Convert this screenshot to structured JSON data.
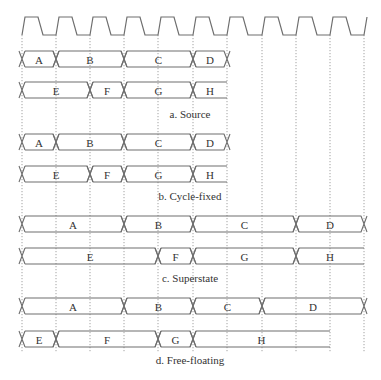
{
  "figure": {
    "width": 381,
    "height": 380,
    "colors": {
      "line": "#6e6e6e",
      "grid": "#8a8a8a",
      "text": "#333333",
      "background": "#ffffff"
    }
  },
  "clock": {
    "edges_x": [
      22,
      56,
      90,
      124,
      158,
      193,
      227,
      262,
      296,
      330,
      364
    ],
    "high_y": 17,
    "low_y": 35,
    "rise_width": 3,
    "fall_start_offset": 16,
    "fall_width": 5
  },
  "grid": {
    "top_y": 35,
    "bottom_y": 352
  },
  "panels": [
    {
      "id": "source",
      "caption": "a. Source",
      "caption_y": 118,
      "rows": [
        {
          "y_top": 51,
          "y_bot": 67,
          "segments": [
            {
              "label": "A",
              "x0": 22,
              "x1": 56,
              "open_end": false
            },
            {
              "label": "B",
              "x0": 56,
              "x1": 124,
              "open_end": false
            },
            {
              "label": "C",
              "x0": 124,
              "x1": 193,
              "open_end": false
            },
            {
              "label": "D",
              "x0": 193,
              "x1": 227,
              "open_end": false
            }
          ]
        },
        {
          "y_top": 82,
          "y_bot": 98,
          "segments": [
            {
              "label": "E",
              "x0": 22,
              "x1": 90,
              "open_end": false
            },
            {
              "label": "F",
              "x0": 90,
              "x1": 124,
              "open_end": false
            },
            {
              "label": "G",
              "x0": 124,
              "x1": 193,
              "open_end": false
            },
            {
              "label": "H",
              "x0": 193,
              "x1": 227,
              "open_end": true
            }
          ]
        }
      ]
    },
    {
      "id": "cycle-fixed",
      "caption": "b. Cycle-fixed",
      "caption_y": 200,
      "rows": [
        {
          "y_top": 134,
          "y_bot": 150,
          "segments": [
            {
              "label": "A",
              "x0": 22,
              "x1": 56,
              "open_end": false
            },
            {
              "label": "B",
              "x0": 56,
              "x1": 124,
              "open_end": false
            },
            {
              "label": "C",
              "x0": 124,
              "x1": 193,
              "open_end": false
            },
            {
              "label": "D",
              "x0": 193,
              "x1": 227,
              "open_end": false
            }
          ]
        },
        {
          "y_top": 166,
          "y_bot": 182,
          "segments": [
            {
              "label": "E",
              "x0": 22,
              "x1": 90,
              "open_end": false
            },
            {
              "label": "F",
              "x0": 90,
              "x1": 124,
              "open_end": false
            },
            {
              "label": "G",
              "x0": 124,
              "x1": 193,
              "open_end": false
            },
            {
              "label": "H",
              "x0": 193,
              "x1": 227,
              "open_end": true
            }
          ]
        }
      ]
    },
    {
      "id": "superstate",
      "caption": "c. Superstate",
      "caption_y": 282,
      "rows": [
        {
          "y_top": 216,
          "y_bot": 232,
          "segments": [
            {
              "label": "A",
              "x0": 22,
              "x1": 124,
              "open_end": false
            },
            {
              "label": "B",
              "x0": 124,
              "x1": 193,
              "open_end": false
            },
            {
              "label": "C",
              "x0": 193,
              "x1": 296,
              "open_end": false
            },
            {
              "label": "D",
              "x0": 296,
              "x1": 364,
              "open_end": false
            }
          ]
        },
        {
          "y_top": 248,
          "y_bot": 264,
          "segments": [
            {
              "label": "E",
              "x0": 22,
              "x1": 158,
              "open_end": false
            },
            {
              "label": "F",
              "x0": 158,
              "x1": 193,
              "open_end": false
            },
            {
              "label": "G",
              "x0": 193,
              "x1": 296,
              "open_end": false
            },
            {
              "label": "H",
              "x0": 296,
              "x1": 364,
              "open_end": true
            }
          ]
        }
      ]
    },
    {
      "id": "free-floating",
      "caption": "d. Free-floating",
      "caption_y": 364,
      "rows": [
        {
          "y_top": 298,
          "y_bot": 314,
          "segments": [
            {
              "label": "A",
              "x0": 22,
              "x1": 124,
              "open_end": false
            },
            {
              "label": "B",
              "x0": 124,
              "x1": 193,
              "open_end": false
            },
            {
              "label": "C",
              "x0": 193,
              "x1": 262,
              "open_end": false
            },
            {
              "label": "D",
              "x0": 262,
              "x1": 364,
              "open_end": false
            }
          ]
        },
        {
          "y_top": 331,
          "y_bot": 347,
          "segments": [
            {
              "label": "E",
              "x0": 22,
              "x1": 56,
              "open_end": false
            },
            {
              "label": "F",
              "x0": 56,
              "x1": 158,
              "open_end": false
            },
            {
              "label": "G",
              "x0": 158,
              "x1": 193,
              "open_end": false
            },
            {
              "label": "H",
              "x0": 193,
              "x1": 330,
              "open_end": true
            }
          ]
        }
      ]
    }
  ]
}
